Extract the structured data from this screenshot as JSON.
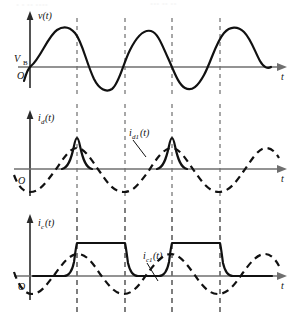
{
  "figure": {
    "panels": [
      {
        "id": "panel-voltage",
        "y_axis_label": "v(t)",
        "x_axis_label": "t",
        "origin_label": "O",
        "level_label": "V",
        "level_sublabel": "B",
        "series": [
          {
            "name": "v(t)",
            "style": "solid",
            "description": "Sinusoidal source voltage centered on the V_B level"
          }
        ]
      },
      {
        "id": "panel-diode-current",
        "y_axis_label": "i",
        "y_axis_sublabel": "d",
        "y_axis_suffix": "(t)",
        "x_axis_label": "t",
        "origin_label": "O",
        "annotation_label": "i",
        "annotation_sublabel": "d1",
        "annotation_suffix": "(t)",
        "series": [
          {
            "name": "i_d(t)",
            "style": "solid",
            "description": "Narrow conduction current spikes at each positive peak"
          },
          {
            "name": "i_d1(t)",
            "style": "dashed",
            "description": "Smooth sinusoidal fundamental component"
          }
        ]
      },
      {
        "id": "panel-capacitor-current",
        "y_axis_label": "i",
        "y_axis_sublabel": "c",
        "y_axis_suffix": "(t)",
        "x_axis_label": "t",
        "origin_label": "O",
        "annotation_label": "i",
        "annotation_sublabel": "c1",
        "annotation_suffix": "(t)",
        "series": [
          {
            "name": "i_c(t)",
            "style": "solid",
            "description": "Square wave pulses with rounded rising and falling edges"
          },
          {
            "name": "i_c1(t)",
            "style": "dashed",
            "description": "Smooth sinusoidal fundamental component"
          }
        ]
      }
    ],
    "guides": {
      "count": 4,
      "description": "Vertical dashed alignment lines through all three panels"
    },
    "colors": {
      "curve": "#111111",
      "axis": "#6f6f6f",
      "vertical_axis": "#2a2a2a",
      "guide": "#8a8a8a",
      "background": "#ffffff"
    }
  }
}
